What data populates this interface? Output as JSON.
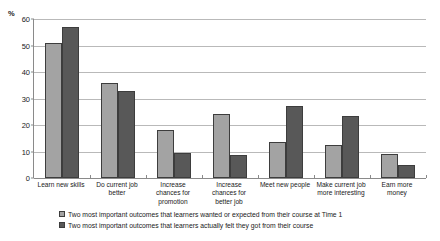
{
  "chart_data": {
    "type": "bar",
    "title": "",
    "subtitle": "",
    "xlabel": "",
    "ylabel": "%",
    "ylim": [
      0,
      60
    ],
    "yticks": [
      0,
      10,
      20,
      30,
      40,
      50,
      60
    ],
    "grid": true,
    "legend_position": "bottom",
    "categories": [
      "Learn new skills",
      "Do current job better",
      "Increase chances for promotion",
      "Increase chances for better job",
      "Meet new people",
      "Make current job more interesting",
      "Earn more money"
    ],
    "category_lines": [
      [
        "Learn new skills"
      ],
      [
        "Do current job",
        "better"
      ],
      [
        "Increase",
        "chances for",
        "promotion"
      ],
      [
        "Increase",
        "chances for",
        "better job"
      ],
      [
        "Meet new people"
      ],
      [
        "Make current job",
        "more interesting"
      ],
      [
        "Earn more",
        "money"
      ]
    ],
    "series": [
      {
        "name": "Two most important outcomes that learners wanted or expected from their course at Time 1",
        "color": "#a3a3a3",
        "values": [
          51,
          36,
          18,
          24,
          13.5,
          12.5,
          9
        ]
      },
      {
        "name": "Two most important outcomes that learners actually felt they got from their course",
        "color": "#585858",
        "values": [
          57,
          33,
          9.5,
          8.5,
          27,
          23.5,
          5
        ]
      }
    ]
  },
  "axis": {
    "unit_label": "%"
  },
  "legend": {
    "items": [
      {
        "label": "Two most important outcomes that learners wanted or expected from their course at Time 1",
        "swatch": "series-a"
      },
      {
        "label": "Two most important outcomes that learners actually felt they got from their course",
        "swatch": "series-b"
      }
    ]
  }
}
